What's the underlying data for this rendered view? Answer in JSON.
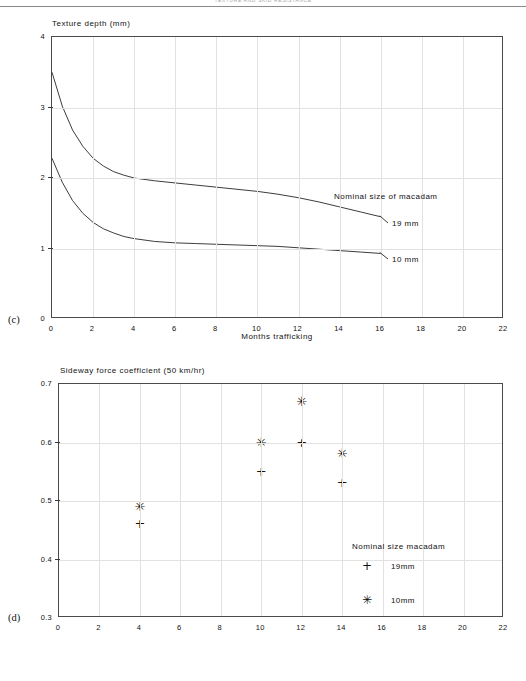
{
  "page": {
    "running_head": "TEXTURE AND SKID RESISTANCE"
  },
  "figure_c": {
    "panel_letter": "(c)",
    "y_axis_title": "Texture depth (mm)",
    "x_axis_label": "Months trafficking",
    "legend_title": "Nominal size of macadam",
    "series_labels": [
      "19 mm",
      "10 mm"
    ]
  },
  "figure_d": {
    "panel_letter": "(d)",
    "y_axis_title": "Sideway force coefficient (50 km/hr)",
    "legend_title": "Nominal size macadam",
    "legend_items": [
      {
        "marker": "+",
        "label": "19mm"
      },
      {
        "marker": "✳",
        "label": "10mm"
      }
    ]
  },
  "chart_data": [
    {
      "id": "c",
      "type": "line",
      "title": "Texture depth (mm)",
      "xlabel": "Months trafficking",
      "ylabel": "Texture depth (mm)",
      "xlim": [
        0,
        22
      ],
      "ylim": [
        0,
        4
      ],
      "xticks": [
        0,
        2,
        4,
        6,
        8,
        10,
        12,
        14,
        16,
        18,
        20,
        22
      ],
      "yticks": [
        0,
        1,
        2,
        3,
        4
      ],
      "grid": true,
      "legend_position": "inside-right",
      "legend_title": "Nominal size of macadam",
      "series": [
        {
          "name": "19 mm",
          "x": [
            0,
            0.5,
            1,
            1.5,
            2,
            2.5,
            3,
            3.5,
            4,
            5,
            6,
            7,
            8,
            9,
            10,
            11,
            12,
            13,
            14,
            15,
            16
          ],
          "y": [
            3.5,
            3.02,
            2.68,
            2.45,
            2.28,
            2.17,
            2.09,
            2.04,
            2.0,
            1.96,
            1.93,
            1.9,
            1.87,
            1.84,
            1.81,
            1.77,
            1.72,
            1.66,
            1.59,
            1.52,
            1.45
          ]
        },
        {
          "name": "10 mm",
          "x": [
            0,
            0.5,
            1,
            1.5,
            2,
            2.5,
            3,
            3.5,
            4,
            5,
            6,
            7,
            8,
            9,
            10,
            11,
            12,
            13,
            14,
            15,
            16
          ],
          "y": [
            2.28,
            1.94,
            1.68,
            1.5,
            1.37,
            1.28,
            1.22,
            1.17,
            1.14,
            1.1,
            1.08,
            1.07,
            1.06,
            1.05,
            1.04,
            1.03,
            1.01,
            0.99,
            0.97,
            0.95,
            0.93
          ]
        }
      ]
    },
    {
      "id": "d",
      "type": "scatter",
      "title": "Sideway force coefficient (50 km/hr)",
      "xlabel": "",
      "ylabel": "Sideway force coefficient (50 km/hr)",
      "xlim": [
        0,
        22
      ],
      "ylim": [
        0.3,
        0.7
      ],
      "xticks": [
        0,
        2,
        4,
        6,
        8,
        10,
        12,
        14,
        16,
        18,
        20,
        22
      ],
      "yticks": [
        0.3,
        0.4,
        0.5,
        0.6,
        0.7
      ],
      "grid": true,
      "legend_position": "inside-right",
      "legend_title": "Nominal size macadam",
      "series": [
        {
          "name": "19mm",
          "marker": "+",
          "points": [
            {
              "x": 4,
              "y": 0.46
            },
            {
              "x": 10,
              "y": 0.55
            },
            {
              "x": 12,
              "y": 0.6
            },
            {
              "x": 14,
              "y": 0.53
            }
          ]
        },
        {
          "name": "10mm",
          "marker": "✳",
          "points": [
            {
              "x": 4,
              "y": 0.49
            },
            {
              "x": 10,
              "y": 0.6
            },
            {
              "x": 12,
              "y": 0.67
            },
            {
              "x": 14,
              "y": 0.58
            }
          ]
        }
      ]
    }
  ]
}
